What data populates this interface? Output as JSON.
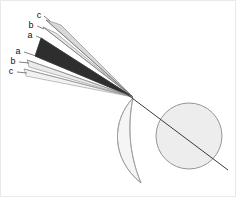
{
  "figure": {
    "background_color": "#ffffff",
    "border_color": "#e9e9e9",
    "apex": {
      "x": 133,
      "y": 97
    },
    "labels": {
      "upper": [
        {
          "id": "upper-c",
          "text": "c",
          "x": 39,
          "y": 18
        },
        {
          "id": "upper-b",
          "text": "b",
          "x": 31,
          "y": 27
        },
        {
          "id": "upper-a",
          "text": "a",
          "x": 30,
          "y": 37
        }
      ],
      "lower": [
        {
          "id": "lower-a",
          "text": "a",
          "x": 18,
          "y": 53
        },
        {
          "id": "lower-b",
          "text": "b",
          "x": 13,
          "y": 63
        },
        {
          "id": "lower-c",
          "text": "c",
          "x": 11,
          "y": 73
        }
      ]
    },
    "wedges": [
      {
        "id": "wedge-upper-c",
        "fill": "#d8d8d8",
        "stroke": "#8f8f8f"
      },
      {
        "id": "wedge-upper-b",
        "fill": "#e4e4e4",
        "stroke": "#909090"
      },
      {
        "id": "wedge-core-dark",
        "fill": "#2e2e2e",
        "stroke": "#2e2e2e"
      },
      {
        "id": "wedge-lower-b",
        "fill": "#ebebeb",
        "stroke": "#9a9a9a"
      },
      {
        "id": "wedge-lower-c",
        "fill": "#f1f1f1",
        "stroke": "#a2a2a2"
      }
    ],
    "sphere": {
      "id": "sphere",
      "cx": 189,
      "cy": 136,
      "r": 33,
      "fill": "#ededed",
      "stroke": "#8a8a8a"
    },
    "lens": {
      "id": "lens",
      "fill": "#f4f4f4",
      "stroke": "#9b9b9b",
      "top": {
        "x": 133,
        "y": 98
      },
      "bottom": {
        "x": 141,
        "y": 183
      }
    },
    "axis": {
      "id": "optical-axis",
      "color": "#3a3a3a",
      "x1": 120,
      "y1": 89,
      "x2": 228,
      "y2": 170
    },
    "leaders": {
      "color": "#4a4a4a"
    }
  }
}
